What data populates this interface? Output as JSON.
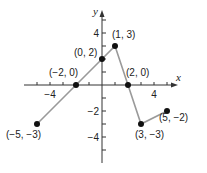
{
  "chart_data": {
    "type": "line",
    "title": "",
    "xlabel": "x",
    "ylabel": "y",
    "xlim": [
      -6,
      6
    ],
    "ylim": [
      -6,
      6
    ],
    "x_ticks": [
      -5,
      -4,
      -3,
      -2,
      -1,
      1,
      2,
      3,
      4,
      5
    ],
    "x_tick_labels": [
      {
        "value": -4,
        "label": "−4"
      },
      {
        "value": 4,
        "label": "4"
      }
    ],
    "y_ticks": [
      -5,
      -4,
      -3,
      -2,
      -1,
      1,
      2,
      3,
      4,
      5
    ],
    "y_tick_labels": [
      {
        "value": 4,
        "label": "4"
      },
      {
        "value": -2,
        "label": "−2"
      },
      {
        "value": -4,
        "label": "−4"
      }
    ],
    "series": [
      {
        "name": "piecewise",
        "color": "#9a9a9a",
        "points": [
          {
            "x": -5,
            "y": -3,
            "label": "(−5, −3)"
          },
          {
            "x": -2,
            "y": 0,
            "label": "(−2, 0)"
          },
          {
            "x": 0,
            "y": 2,
            "label": "(0, 2)"
          },
          {
            "x": 1,
            "y": 3,
            "label": "(1, 3)"
          },
          {
            "x": 2,
            "y": 0,
            "label": "(2, 0)"
          },
          {
            "x": 3,
            "y": -3,
            "label": "(3, −3)"
          },
          {
            "x": 5,
            "y": -2,
            "label": "(5, −2)"
          }
        ]
      }
    ],
    "grid": false,
    "legend": null
  },
  "layout": {
    "origin": [
      102,
      85
    ],
    "unit": 13,
    "x_axis_range_px": [
      24,
      178
    ],
    "y_axis_range_px": [
      10,
      163
    ],
    "point_label_offsets": [
      [
        -31,
        14
      ],
      [
        -27,
        -9
      ],
      [
        -28,
        -3
      ],
      [
        -3,
        -8
      ],
      [
        -2,
        -9
      ],
      [
        -6,
        14
      ],
      [
        -8,
        10
      ]
    ]
  }
}
